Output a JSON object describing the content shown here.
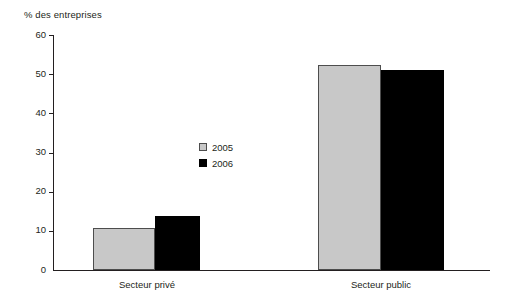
{
  "chart_data": {
    "type": "bar",
    "title": "",
    "subtitle": "",
    "xlabel": "",
    "ylabel": "% des entreprises",
    "categories": [
      "Secteur privé",
      "Secteur public"
    ],
    "series": [
      {
        "name": "2005",
        "color": "#c8c8c8",
        "values": [
          10.7,
          52.3
        ]
      },
      {
        "name": "2006",
        "color": "#000000",
        "values": [
          13.8,
          51.0
        ]
      }
    ],
    "ylim": [
      0,
      60
    ],
    "yticks": [
      0,
      10,
      20,
      30,
      40,
      50,
      60
    ],
    "ytick_labels": [
      "0",
      "10",
      "20",
      "30",
      "40",
      "50",
      "60"
    ],
    "grid": false,
    "legend_position": "inside-center-left",
    "legend_entries": [
      "2005",
      "2006"
    ]
  }
}
